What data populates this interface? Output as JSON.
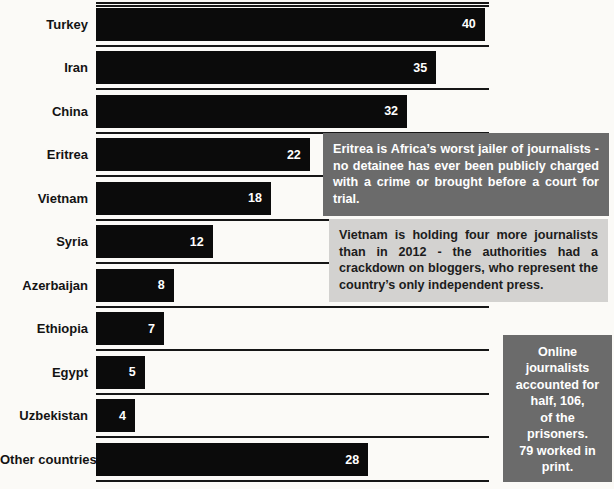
{
  "chart_data": {
    "type": "bar",
    "orientation": "horizontal",
    "title": "",
    "xlabel": "",
    "ylabel": "",
    "xlim": [
      0,
      40.5
    ],
    "grid": false,
    "bar_color": "#0b0b0b",
    "value_label_color": "#ffffff",
    "categories": [
      "Turkey",
      "Iran",
      "China",
      "Eritrea",
      "Vietnam",
      "Syria",
      "Azerbaijan",
      "Ethiopia",
      "Egypt",
      "Uzbekistan",
      "Other countries*"
    ],
    "values": [
      40,
      35,
      32,
      22,
      18,
      12,
      8,
      7,
      5,
      4,
      28
    ]
  },
  "annotations": {
    "eritrea_note": {
      "text": "Eritrea is Africa’s worst jailer of journalists - no detainee has ever been publicly charged with a crime or brought before a court for trial.",
      "bg": "#6b6b6b",
      "color": "#ffffff"
    },
    "vietnam_note": {
      "text": "Vietnam is holding four more journalists than in 2012 - the authorities had a crackdown on bloggers, who represent the country’s only independent press.",
      "bg": "#d3d2d0",
      "color": "#1c1c1c"
    },
    "online_note": {
      "text": "Online\njournalists\naccounted for\nhalf, 106,\nof the\nprisoners.\n79 worked in\nprint.",
      "bg": "#6b6b6b",
      "color": "#ffffff"
    }
  }
}
